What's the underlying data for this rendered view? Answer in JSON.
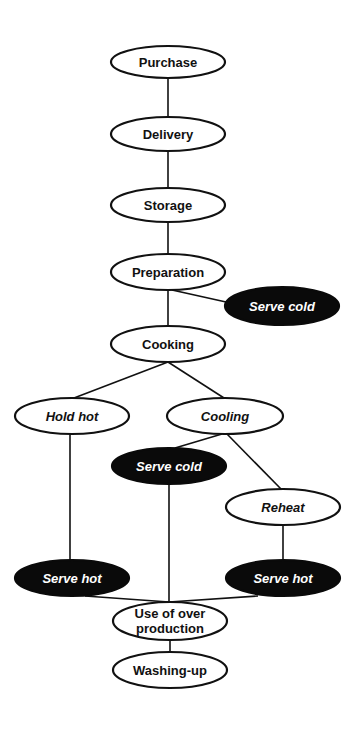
{
  "diagram": {
    "nodes": {
      "purchase": {
        "label": "Purchase",
        "style": "plain"
      },
      "delivery": {
        "label": "Delivery",
        "style": "plain"
      },
      "storage": {
        "label": "Storage",
        "style": "plain"
      },
      "preparation": {
        "label": "Preparation",
        "style": "plain"
      },
      "serve_cold_1": {
        "label": "Serve cold",
        "style": "dark-italic"
      },
      "cooking": {
        "label": "Cooking",
        "style": "plain"
      },
      "hold_hot": {
        "label": "Hold hot",
        "style": "italic"
      },
      "cooling": {
        "label": "Cooling",
        "style": "italic"
      },
      "serve_cold_2": {
        "label": "Serve cold",
        "style": "dark-italic"
      },
      "reheat": {
        "label": "Reheat",
        "style": "italic"
      },
      "serve_hot_1": {
        "label": "Serve hot",
        "style": "dark-italic"
      },
      "serve_hot_2": {
        "label": "Serve hot",
        "style": "dark-italic"
      },
      "use_over_production": {
        "label_line1": "Use of over",
        "label_line2": "production",
        "style": "plain"
      },
      "washing_up": {
        "label": "Washing-up",
        "style": "plain"
      }
    },
    "edges": [
      [
        "Purchase",
        "Delivery"
      ],
      [
        "Delivery",
        "Storage"
      ],
      [
        "Storage",
        "Preparation"
      ],
      [
        "Preparation",
        "Serve cold"
      ],
      [
        "Preparation",
        "Cooking"
      ],
      [
        "Cooking",
        "Hold hot"
      ],
      [
        "Cooking",
        "Cooling"
      ],
      [
        "Cooling",
        "Serve cold"
      ],
      [
        "Cooling",
        "Reheat"
      ],
      [
        "Hold hot",
        "Serve hot"
      ],
      [
        "Reheat",
        "Serve hot"
      ],
      [
        "Serve hot",
        "Use of over production"
      ],
      [
        "Serve cold",
        "Use of over production"
      ],
      [
        "Serve hot",
        "Use of over production"
      ],
      [
        "Use of over production",
        "Washing-up"
      ]
    ],
    "colors": {
      "line": "#111111",
      "dark_fill": "#0a0a0a",
      "light_fill": "#ffffff"
    }
  }
}
